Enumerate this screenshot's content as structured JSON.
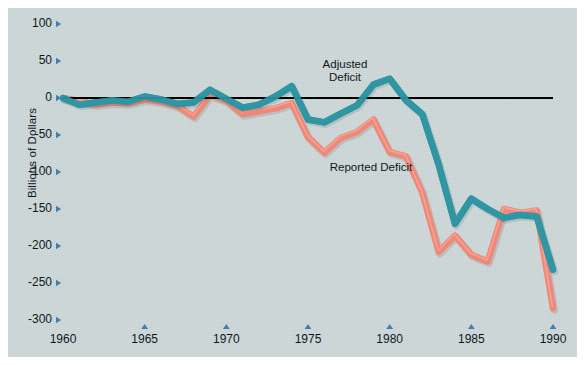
{
  "figure": {
    "background_color": "#ccd7d8",
    "page_color": "#ffffff"
  },
  "axis": {
    "ylabel": "Billions of Dollars",
    "y_ticks": [
      "100",
      "50",
      "0",
      "-50",
      "-100",
      "-150",
      "-200",
      "-250",
      "-300"
    ],
    "y_tick_values": [
      100,
      50,
      0,
      -50,
      -100,
      -150,
      -200,
      -250,
      -300
    ],
    "x_ticks": [
      "1960",
      "1965",
      "1970",
      "1975",
      "1980",
      "1985",
      "1990"
    ],
    "x_tick_values": [
      1960,
      1965,
      1970,
      1975,
      1980,
      1985,
      1990
    ],
    "zero_line_color": "#000000",
    "tick_marker_color": "#3f7fb5"
  },
  "annotations": [
    {
      "name": "adjusted-deficit-label",
      "line1": "Adjusted",
      "line2": "Deficit",
      "x": 337,
      "y": 58
    },
    {
      "name": "reported-deficit-label",
      "line1": "Reported Deficit",
      "line2": "",
      "x": 363,
      "y": 161
    }
  ],
  "chart_data": {
    "type": "line",
    "title": "",
    "xlabel": "",
    "ylabel": "Billions of Dollars",
    "xlim": [
      1959,
      1991
    ],
    "ylim": [
      -310,
      110
    ],
    "grid": false,
    "legend": "inline-annotations",
    "x": [
      1960,
      1961,
      1962,
      1963,
      1964,
      1965,
      1966,
      1967,
      1968,
      1969,
      1970,
      1971,
      1972,
      1973,
      1974,
      1975,
      1976,
      1977,
      1978,
      1979,
      1980,
      1981,
      1982,
      1983,
      1984,
      1985,
      1986,
      1987,
      1988,
      1989,
      1990
    ],
    "series": [
      {
        "name": "Adjusted Deficit",
        "color": "#2f95a3",
        "values": [
          0,
          -9,
          -6,
          -3,
          -5,
          2,
          -2,
          -8,
          -6,
          11,
          -1,
          -13,
          -9,
          2,
          16,
          -29,
          -33,
          -21,
          -10,
          18,
          26,
          -3,
          -22,
          -90,
          -170,
          -136,
          -150,
          -162,
          -158,
          -160,
          -232
        ]
      },
      {
        "name": "Reported Deficit",
        "color": "#f08878",
        "values": [
          0,
          -4,
          -9,
          -6,
          -7,
          -2,
          -5,
          -11,
          -25,
          4,
          -4,
          -22,
          -18,
          -14,
          -7,
          -53,
          -74,
          -54,
          -46,
          -29,
          -73,
          -79,
          -128,
          -208,
          -186,
          -212,
          -221,
          -150,
          -155,
          -152,
          -284
        ]
      }
    ]
  }
}
